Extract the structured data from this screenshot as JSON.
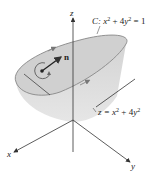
{
  "figure": {
    "type": "3d-surface-diagram",
    "labels": {
      "z_axis": "z",
      "x_axis": "x",
      "y_axis": "y",
      "curve_prefix": "C: ",
      "curve_eq_x": "x",
      "curve_eq_plus": " + 4",
      "curve_eq_y": "y",
      "curve_eq_end": " = 1",
      "surface_prefix": "z = ",
      "surface_x": "x",
      "surface_plus": " + 4",
      "surface_y": "y",
      "sup2": "2",
      "normal": "n"
    },
    "colors": {
      "surface_fill": "#d9d9d9",
      "surface_top": "#cfcfcf",
      "curve": "#8a8a8a",
      "axis": "#333333",
      "text": "#222222"
    }
  }
}
